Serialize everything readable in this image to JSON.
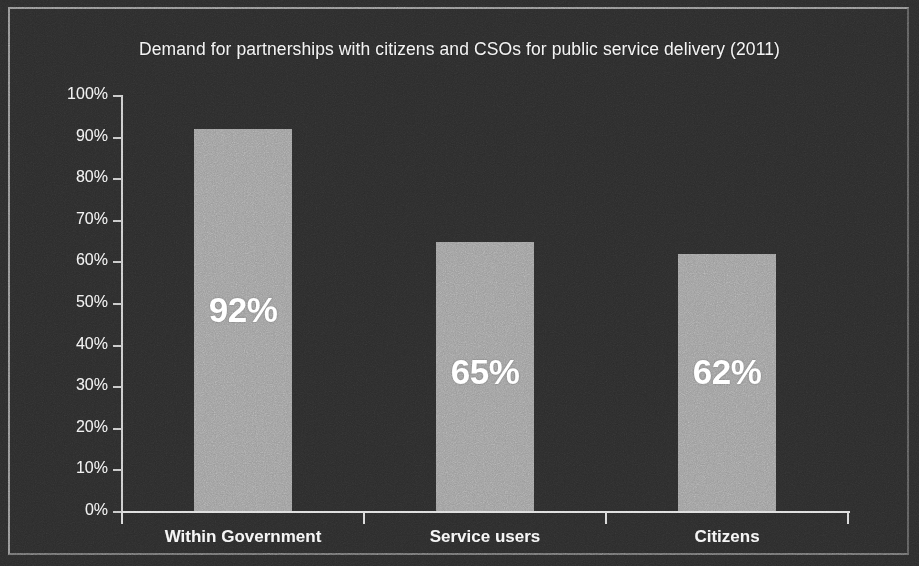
{
  "chart_data": {
    "type": "bar",
    "title": "Demand for partnerships with citizens and CSOs for public service delivery (2011)",
    "categories": [
      "Within Government",
      "Service users",
      "Citizens"
    ],
    "values": [
      92,
      65,
      62
    ],
    "value_labels": [
      "92%",
      "65%",
      "62%"
    ],
    "xlabel": "",
    "ylabel": "",
    "ylim": [
      0,
      100
    ],
    "ytick_labels": [
      "100%",
      "90%",
      "80%",
      "70%",
      "60%",
      "50%",
      "40%",
      "30%",
      "20%",
      "10%",
      "0%"
    ],
    "ytick_values": [
      100,
      90,
      80,
      70,
      60,
      50,
      40,
      30,
      20,
      10,
      0
    ],
    "grid": false,
    "legend": false,
    "bar_color": "#9b9b9b",
    "background_color": "#2b2b2b",
    "text_color": "#f2f2f2",
    "value_label_color": "#ffffff",
    "axis_color": "#d0d0d0"
  }
}
